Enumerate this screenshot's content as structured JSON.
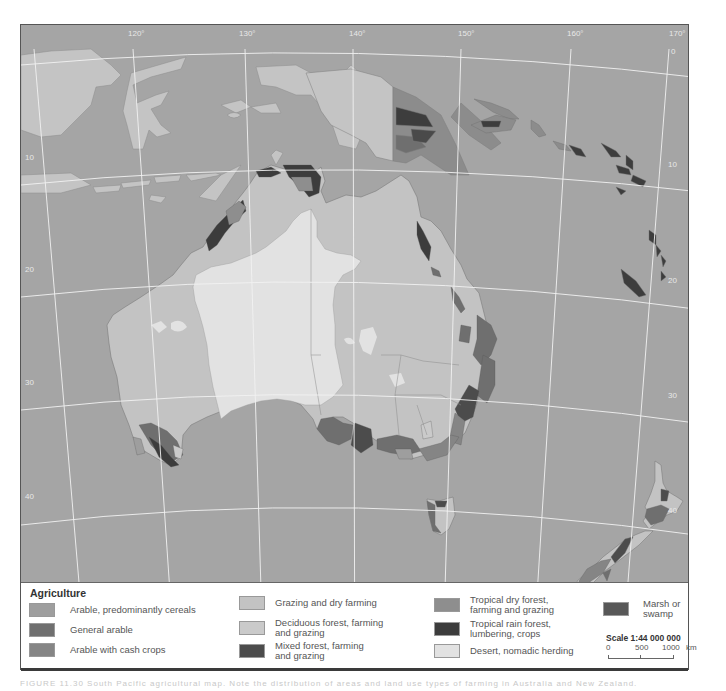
{
  "map": {
    "title": "Agriculture of Australasia",
    "colors": {
      "sea": "#a5a5a5",
      "land_other": "#c2c2c2",
      "graticule": "#f2f2f2",
      "arable_cereals": "#9e9e9e",
      "general_arable": "#6f6f6f",
      "arable_cash_crops": "#858585",
      "grazing_dry_farming": "#c3c3c3",
      "deciduous_forest": "#cacaca",
      "mixed_forest": "#4c4c4c",
      "tropical_dry_forest": "#8e8e8e",
      "tropical_rain_forest": "#3c3c3c",
      "desert": "#e2e2e2",
      "marsh": "#585858"
    },
    "longitude_labels": [
      "120°",
      "130°",
      "140°",
      "150°",
      "160°",
      "170°"
    ],
    "latitude_labels_left": [
      "10",
      "20",
      "30",
      "40"
    ],
    "latitude_labels_right": [
      "0",
      "10",
      "20",
      "30",
      "40"
    ]
  },
  "legend": {
    "title": "Agriculture",
    "items": [
      {
        "label": "Arable, predominantly cereals",
        "color": "#9e9e9e"
      },
      {
        "label": "General arable",
        "color": "#6f6f6f"
      },
      {
        "label": "Arable with cash crops",
        "color": "#858585"
      },
      {
        "label": "Grazing and dry farming",
        "color": "#c3c3c3"
      },
      {
        "label": "Deciduous forest, farming\nand grazing",
        "color": "#cacaca"
      },
      {
        "label": "Mixed forest, farming\nand grazing",
        "color": "#4c4c4c"
      },
      {
        "label": "Tropical dry forest,\nfarming and grazing",
        "color": "#8e8e8e"
      },
      {
        "label": "Tropical rain forest,\nlumbering, crops",
        "color": "#3c3c3c"
      },
      {
        "label": "Desert, nomadic herding",
        "color": "#e2e2e2"
      },
      {
        "label": "Marsh or swamp",
        "color": "#585858"
      }
    ],
    "scale": {
      "title": "Scale 1:44 000 000",
      "ticks": [
        "0",
        "500",
        "1000"
      ],
      "unit": "km"
    }
  },
  "caption": "FIGURE 11.30   South Pacific agricultural map.   Note the distribution of areas and land use types of farming in Australia and New Zealand."
}
